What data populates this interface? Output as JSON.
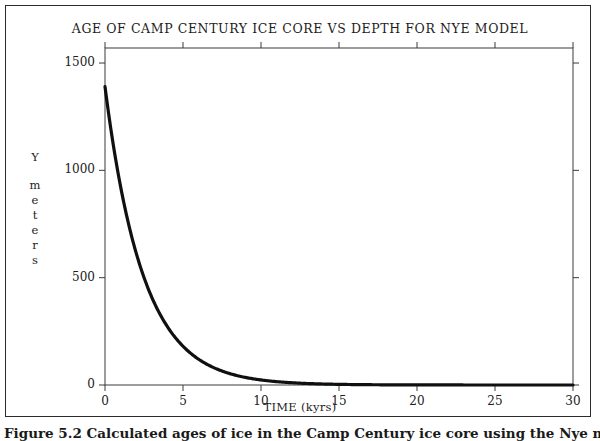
{
  "figure": {
    "caption": "Figure 5.2 Calculated ages of ice in the Camp Century ice core using the Nye model."
  },
  "chart_data": {
    "type": "line",
    "title": "AGE OF CAMP CENTURY ICE CORE VS DEPTH FOR NYE MODEL",
    "xlabel": "TIME (kyrs)",
    "ylabel": "Y meters",
    "ylabel_stacked": [
      "Y",
      "m",
      "e",
      "t",
      "e",
      "r",
      "s"
    ],
    "xlim": [
      0,
      30
    ],
    "ylim": [
      0,
      1570
    ],
    "xticks": [
      0,
      5,
      10,
      15,
      20,
      25,
      30
    ],
    "xtick_labels": [
      "0",
      "5",
      "10",
      "15",
      "20",
      "25",
      "30"
    ],
    "yticks": [
      0,
      500,
      1000,
      1500
    ],
    "ytick_labels": [
      "0",
      "500",
      "1000",
      "1500"
    ],
    "grid": false,
    "legend": null,
    "line_color": "#101010",
    "frame_color": "#3a3a3a",
    "series": [
      {
        "name": "Nye model age-depth",
        "marker": "dots",
        "x": [
          0,
          0.5,
          1,
          1.5,
          2,
          2.5,
          3,
          3.5,
          4,
          4.5,
          5,
          5.5,
          6,
          6.5,
          7,
          7.5,
          8,
          8.5,
          9,
          9.5,
          10,
          11,
          12,
          13,
          14,
          15,
          16,
          17,
          18,
          19,
          20,
          21,
          22,
          23,
          24,
          25,
          26,
          27,
          28,
          29,
          30
        ],
        "y": [
          1390,
          1140,
          935,
          766,
          628,
          515,
          422,
          346,
          284,
          232,
          425,
          156,
          128,
          105,
          86,
          70,
          58,
          47,
          39,
          32,
          130,
          17,
          11,
          7.4,
          4.9,
          3.3,
          2.2,
          1.4,
          1.0,
          0.6,
          0.4,
          0.3,
          0.2,
          0.1,
          0.1,
          0.05,
          0.03,
          0.02,
          0.01,
          0.01,
          0.0
        ],
        "model": {
          "form": "y = A * exp(-t / tau)",
          "A": 1390,
          "tau": 2.45,
          "t_units": "kyrs",
          "y_units": "meters"
        },
        "reference_points": [
          {
            "t": 0,
            "y": 1390
          },
          {
            "t": 5,
            "y": 425
          },
          {
            "t": 10,
            "y": 130
          },
          {
            "t": 15,
            "y": 35
          },
          {
            "t": 20,
            "y": 10
          },
          {
            "t": 25,
            "y": 3
          },
          {
            "t": 30,
            "y": 0
          }
        ]
      }
    ]
  }
}
